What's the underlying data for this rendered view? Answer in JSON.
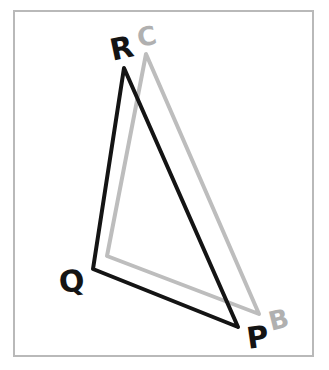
{
  "figure": {
    "background_color": "#ffffff",
    "frame": {
      "name": "border-frame",
      "color": "#b9b9b9",
      "stroke_width": 2,
      "x": 14,
      "y": 11,
      "width": 299,
      "height": 345
    },
    "triangles": [
      {
        "name": "triangle-pqr",
        "label": "PQR",
        "color": "#141414",
        "stroke_width": 4,
        "vertices": [
          {
            "label": "P",
            "x": 238,
            "y": 327
          },
          {
            "label": "Q",
            "x": 93,
            "y": 269
          },
          {
            "label": "R",
            "x": 124,
            "y": 68
          }
        ]
      },
      {
        "name": "triangle-abc",
        "label": "ABC",
        "color": "#bdbdbd",
        "stroke_width": 4,
        "vertices": [
          {
            "label": "A",
            "x": 107,
            "y": 256
          },
          {
            "label": "B",
            "x": 259,
            "y": 314
          },
          {
            "label": "C",
            "x": 146,
            "y": 54
          }
        ]
      }
    ],
    "vertex_labels": [
      {
        "name": "vertex-label-r",
        "text": "R",
        "x": 122,
        "y": 50,
        "color": "#141414",
        "font_size": 30,
        "rotation": -12
      },
      {
        "name": "vertex-label-c",
        "text": "C",
        "x": 147,
        "y": 38,
        "color": "#b0b0b0",
        "font_size": 26,
        "rotation": -12
      },
      {
        "name": "vertex-label-q",
        "text": "Q",
        "x": 72,
        "y": 283,
        "color": "#141414",
        "font_size": 30,
        "rotation": -8
      },
      {
        "name": "vertex-label-p",
        "text": "P",
        "x": 258,
        "y": 339,
        "color": "#141414",
        "font_size": 30,
        "rotation": -8
      },
      {
        "name": "vertex-label-b",
        "text": "B",
        "x": 279,
        "y": 321,
        "color": "#b0b0b0",
        "font_size": 26,
        "rotation": -14
      }
    ]
  }
}
